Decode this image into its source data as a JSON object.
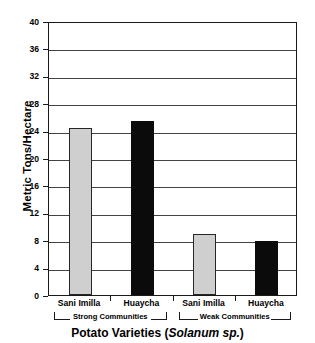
{
  "chart_data": {
    "type": "bar",
    "title": "",
    "xlabel": "Potato Varieties (Solanum sp.)",
    "ylabel": "Metric Tons/Hectare",
    "categories": [
      "Sani Imilla",
      "Huaycha",
      "Sani Imilla",
      "Huaycha"
    ],
    "values": [
      24.4,
      25.4,
      8.9,
      7.9
    ],
    "ylim": [
      0,
      40
    ],
    "yticks": [
      0,
      4,
      8,
      12,
      16,
      20,
      24,
      28,
      32,
      36,
      40
    ],
    "ytick_labels": [
      "0",
      "4",
      "8",
      "12",
      "16",
      "20",
      "24",
      "28",
      "32",
      "36",
      "40"
    ],
    "grid": true,
    "legend": "none",
    "bar_colors": [
      "#cfcfcf",
      "#0b0b0b",
      "#cfcfcf",
      "#0b0b0b"
    ],
    "groups": [
      {
        "label": "Strong Communities",
        "members": [
          0,
          1
        ]
      },
      {
        "label": "Weak Communities",
        "members": [
          2,
          3
        ]
      }
    ],
    "bars": [
      {
        "category": "Sani Imilla",
        "value": 24.4,
        "group": "Strong Communities",
        "fill": "light"
      },
      {
        "category": "Huaycha",
        "value": 25.4,
        "group": "Strong Communities",
        "fill": "dark"
      },
      {
        "category": "Sani Imilla",
        "value": 8.9,
        "group": "Weak Communities",
        "fill": "light"
      },
      {
        "category": "Huaycha",
        "value": 7.9,
        "group": "Weak Communities",
        "fill": "dark"
      }
    ]
  },
  "axis_title_x_parts": {
    "lead": "Potato Varieties  (",
    "italic": "Solanum sp.",
    "trail": ")"
  },
  "colors": {
    "axis": "#1a1a1a",
    "grid": "#434343",
    "bar_light": "#cfcfcf",
    "bar_dark": "#0b0b0b",
    "background": "#ffffff"
  }
}
